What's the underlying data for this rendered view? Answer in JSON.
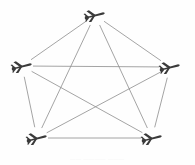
{
  "figure": {
    "background_color": "#fefefe",
    "edge_color": "#8d8d8d",
    "node_color": "#3a3a3a",
    "width": 195,
    "height": 165
  },
  "caption": {
    "text": "——  ————  ———",
    "note": "faint cropped caption"
  },
  "chart_data": {
    "type": "diagram",
    "layout": "pentagon",
    "graph_kind": "complete-graph-K5",
    "node_count": 5,
    "edge_count": 10,
    "node_glyph": "aircraft-icon",
    "nodes": [
      {
        "id": "n1",
        "label": "UAV 1",
        "x": 95,
        "y": 15,
        "position": "top"
      },
      {
        "id": "n2",
        "label": "UAV 2",
        "x": 22,
        "y": 66,
        "position": "left"
      },
      {
        "id": "n3",
        "label": "UAV 3",
        "x": 170,
        "y": 67,
        "position": "right"
      },
      {
        "id": "n4",
        "label": "UAV 4",
        "x": 37,
        "y": 138,
        "position": "bottom-left"
      },
      {
        "id": "n5",
        "label": "UAV 5",
        "x": 152,
        "y": 138,
        "position": "bottom-right"
      }
    ],
    "edges": [
      {
        "from": "n1",
        "to": "n2"
      },
      {
        "from": "n1",
        "to": "n3"
      },
      {
        "from": "n1",
        "to": "n4"
      },
      {
        "from": "n1",
        "to": "n5"
      },
      {
        "from": "n2",
        "to": "n3"
      },
      {
        "from": "n2",
        "to": "n4"
      },
      {
        "from": "n2",
        "to": "n5"
      },
      {
        "from": "n3",
        "to": "n4"
      },
      {
        "from": "n3",
        "to": "n5"
      },
      {
        "from": "n4",
        "to": "n5"
      }
    ]
  }
}
